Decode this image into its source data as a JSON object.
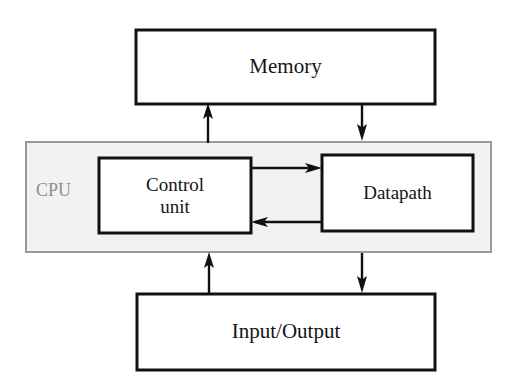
{
  "diagram": {
    "background_color": "#ffffff",
    "line_color": "#111111",
    "cpu_fill_color": "#f2f2f2",
    "cpu_border_color": "#9a9a9a",
    "cpu_label_color": "#8d8d8d"
  },
  "blocks": {
    "memory": {
      "label": "Memory",
      "x": 136,
      "y": 30,
      "width": 299,
      "height": 74,
      "fill": "#ffffff",
      "stroke": "#111111",
      "stroke_width": 3
    },
    "cpu": {
      "label": "CPU",
      "x": 26,
      "y": 142,
      "width": 465,
      "height": 110,
      "fill": "#f2f2f2",
      "stroke": "#9a9a9a",
      "stroke_width": 2
    },
    "control_unit": {
      "label": "Control\nunit",
      "x": 99,
      "y": 158,
      "width": 152,
      "height": 75,
      "fill": "#ffffff",
      "stroke": "#111111",
      "stroke_width": 3
    },
    "datapath": {
      "label": "Datapath",
      "x": 322,
      "y": 155,
      "width": 151,
      "height": 76,
      "fill": "#ffffff",
      "stroke": "#111111",
      "stroke_width": 3
    },
    "input_output": {
      "label": "Input/Output",
      "x": 137,
      "y": 294,
      "width": 298,
      "height": 76,
      "fill": "#ffffff",
      "stroke": "#111111",
      "stroke_width": 3
    }
  },
  "arrows": [
    {
      "name": "control-unit-to-memory",
      "from": "control_unit",
      "to": "memory",
      "direction": "up",
      "x1": 208,
      "y1": 142,
      "x2": 208,
      "y2": 105
    },
    {
      "name": "memory-to-datapath",
      "from": "memory",
      "to": "datapath",
      "direction": "down",
      "x1": 362,
      "y1": 103,
      "x2": 362,
      "y2": 141
    },
    {
      "name": "control-unit-to-datapath",
      "from": "control_unit",
      "to": "datapath",
      "direction": "right",
      "x1": 251,
      "y1": 168,
      "x2": 321,
      "y2": 168
    },
    {
      "name": "datapath-to-control-unit",
      "from": "datapath",
      "to": "control_unit",
      "direction": "left",
      "x1": 322,
      "y1": 222,
      "x2": 252,
      "y2": 222
    },
    {
      "name": "input-output-to-control-unit",
      "from": "input_output",
      "to": "cpu",
      "direction": "up",
      "x1": 209,
      "y1": 293,
      "x2": 209,
      "y2": 253
    },
    {
      "name": "datapath-to-input-output",
      "from": "cpu",
      "to": "input_output",
      "direction": "down",
      "x1": 362,
      "y1": 253,
      "x2": 362,
      "y2": 292
    }
  ]
}
